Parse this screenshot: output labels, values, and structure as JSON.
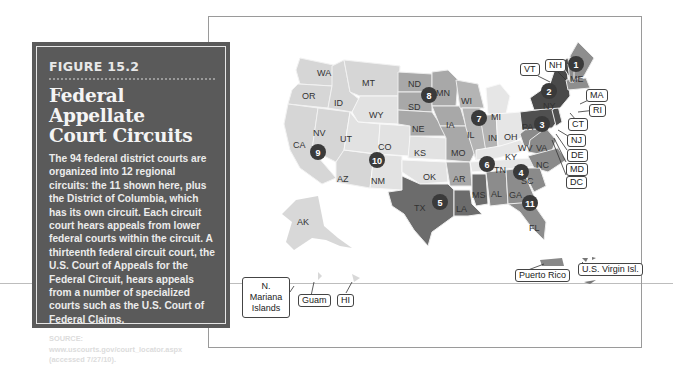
{
  "panel": {
    "figure_label": "FIGURE 15.2",
    "title_line1": "Federal Appellate",
    "title_line2": "Court Circuits",
    "body": "The 94 federal district courts are organized into 12 regional circuits: the 11 shown here, plus the District of Columbia, which has its own circuit. Each circuit court hears appeals from lower federal courts within the circuit. A thirteenth federal circuit court, the U.S. Court of Appeals for the Federal Circuit, hears appeals from a number of specialized courts such as the U.S. Court of Federal Claims.",
    "source_line1": "SOURCE: www.uscourts.gov/court_locator.aspx",
    "source_line2": "(accessed 7/27/10)."
  },
  "map": {
    "colors": {
      "light": "#d6d6d6",
      "lighter": "#e4e4e4",
      "mid": "#a8a8a8",
      "midlight": "#bdbdbd",
      "dark": "#6e6e6e",
      "darker": "#4f4f4f",
      "circle": "#3a3a3a"
    },
    "state_labels": {
      "WA": "WA",
      "OR": "OR",
      "ID": "ID",
      "MT": "MT",
      "WY": "WY",
      "CA": "CA",
      "NV": "NV",
      "UT": "UT",
      "CO": "CO",
      "AZ": "AZ",
      "NM": "NM",
      "ND": "ND",
      "SD": "SD",
      "NE": "NE",
      "KS": "KS",
      "OK": "OK",
      "TX": "TX",
      "MN": "MN",
      "IA": "IA",
      "MO": "MO",
      "AR": "AR",
      "LA": "LA",
      "WI": "WI",
      "IL": "IL",
      "IN": "IN",
      "MI": "MI",
      "OH": "OH",
      "KY": "KY",
      "TN": "TN",
      "MS": "MS",
      "AL": "AL",
      "GA": "GA",
      "FL": "FL",
      "SC": "SC",
      "NC": "NC",
      "VA": "VA",
      "WV": "WV",
      "PA": "PA",
      "NY": "NY",
      "ME": "ME",
      "AK": "AK"
    },
    "circuits": [
      "1",
      "2",
      "3",
      "4",
      "5",
      "6",
      "7",
      "8",
      "9",
      "10",
      "11"
    ],
    "callouts": {
      "VT": "VT",
      "NH": "NH",
      "MA": "MA",
      "RI": "RI",
      "CT": "CT",
      "NJ": "NJ",
      "DE": "DE",
      "MD": "MD",
      "DC": "DC",
      "puerto_rico": "Puerto Rico",
      "virgin_islands": "U.S. Virgin Isl.",
      "n_mariana": "N. Mariana Islands",
      "guam": "Guam",
      "hi": "HI"
    }
  }
}
